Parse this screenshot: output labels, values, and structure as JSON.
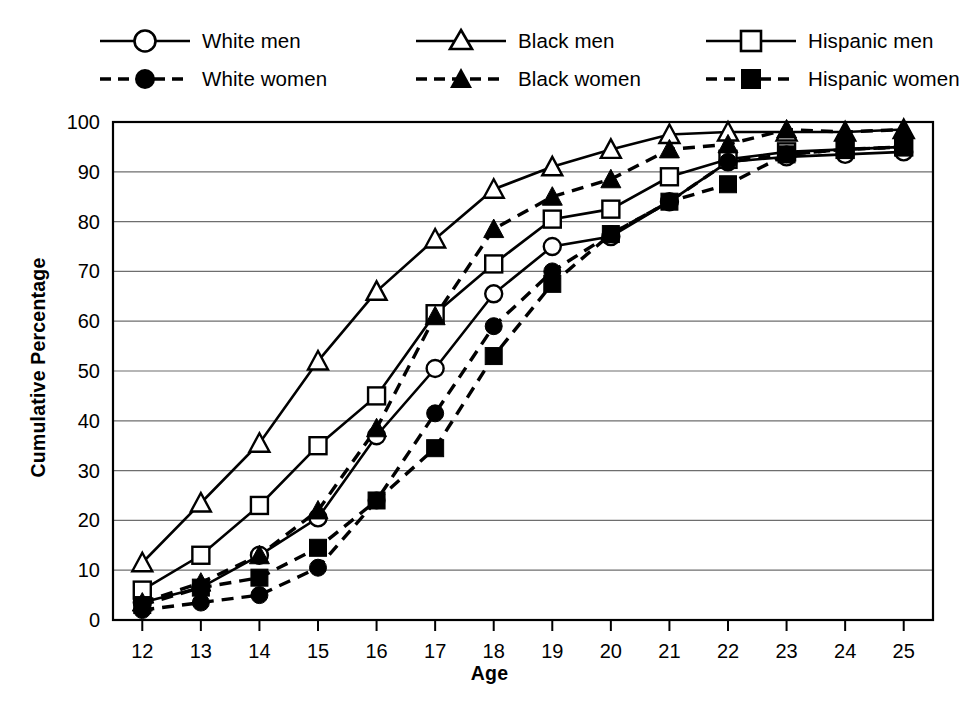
{
  "chart_data": {
    "type": "line",
    "title": "",
    "xlabel": "Age",
    "ylabel": "Cumulative Percentage",
    "x": [
      12,
      13,
      14,
      15,
      16,
      17,
      18,
      19,
      20,
      21,
      22,
      23,
      24,
      25
    ],
    "xtick_labels": [
      "12",
      "13",
      "14",
      "15",
      "16",
      "17",
      "18",
      "19",
      "20",
      "21",
      "22",
      "23",
      "24",
      "25"
    ],
    "ytick_labels": [
      "0",
      "10",
      "20",
      "30",
      "40",
      "50",
      "60",
      "70",
      "80",
      "90",
      "100"
    ],
    "xlim": [
      11.5,
      25.5
    ],
    "ylim": [
      0,
      100
    ],
    "grid": true,
    "legend_position": "top",
    "series": [
      {
        "name": "White men",
        "marker": "open-circle",
        "line": "solid",
        "values": [
          3.5,
          6.5,
          13.0,
          20.5,
          37.0,
          50.5,
          65.5,
          75.0,
          77.0,
          84.0,
          92.0,
          93.0,
          93.5,
          94.0
        ]
      },
      {
        "name": "Black men",
        "marker": "open-triangle",
        "line": "solid",
        "values": [
          11.5,
          23.5,
          35.5,
          52.0,
          66.0,
          76.5,
          86.5,
          91.0,
          94.5,
          97.5,
          98.0,
          98.0,
          98.0,
          98.5
        ]
      },
      {
        "name": "Hispanic men",
        "marker": "open-square",
        "line": "solid",
        "values": [
          6.0,
          13.0,
          23.0,
          35.0,
          45.0,
          61.5,
          71.5,
          80.5,
          82.5,
          89.0,
          92.5,
          94.0,
          94.5,
          95.0
        ]
      },
      {
        "name": "White women",
        "marker": "filled-circle",
        "line": "dashed",
        "values": [
          2.0,
          3.5,
          5.0,
          10.5,
          24.0,
          41.5,
          59.0,
          70.0,
          77.5,
          84.0,
          92.0,
          93.5,
          94.5,
          95.0
        ]
      },
      {
        "name": "Black women",
        "marker": "filled-triangle",
        "line": "dashed",
        "values": [
          3.5,
          7.5,
          13.0,
          22.0,
          38.5,
          61.0,
          78.5,
          85.0,
          88.5,
          94.5,
          95.5,
          98.5,
          98.0,
          98.5
        ]
      },
      {
        "name": "Hispanic women",
        "marker": "filled-square",
        "line": "dashed",
        "values": [
          3.0,
          6.5,
          8.5,
          14.5,
          24.0,
          34.5,
          53.0,
          67.5,
          77.5,
          84.0,
          87.5,
          93.5,
          94.5,
          95.0
        ]
      }
    ]
  },
  "colors": {
    "line": "#000000",
    "grid": "#6e6e6e",
    "frame": "#000000",
    "background": "#ffffff"
  }
}
